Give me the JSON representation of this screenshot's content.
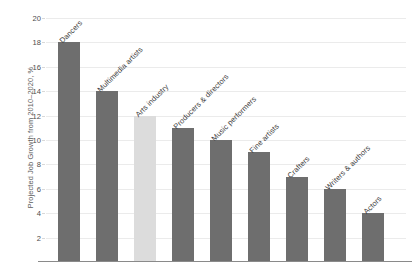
{
  "chart_data": {
    "type": "bar",
    "title": "",
    "xlabel": "",
    "ylabel": "Projected Job Growth from 2010–2020, %",
    "ylim": [
      0,
      20
    ],
    "ytick_step": 2,
    "yticks": [
      20,
      18,
      16,
      14,
      12,
      10,
      8,
      6,
      4,
      2
    ],
    "grid": true,
    "legend": "none",
    "categories": [
      "Dancers",
      "Multimedia artists",
      "Arts industry",
      "Producers & directors",
      "Music performers",
      "Fine artists",
      "Crafters",
      "Writers & authors",
      "Actors"
    ],
    "values": [
      18,
      14,
      12,
      11,
      10,
      9,
      7,
      6,
      4
    ],
    "bar_colors": [
      "#6e6e6e",
      "#6e6e6e",
      "#dcdcdc",
      "#6e6e6e",
      "#6e6e6e",
      "#6e6e6e",
      "#6e6e6e",
      "#6e6e6e",
      "#6e6e6e"
    ],
    "highlight_index": 2
  },
  "colors": {
    "bar_default": "#6e6e6e",
    "bar_highlight": "#dcdcdc",
    "gridline": "#ebebeb",
    "axis": "#8a8a8a",
    "tick_text": "#4d4d4d",
    "label_text": "#3d3d3d",
    "background": "#ffffff"
  }
}
